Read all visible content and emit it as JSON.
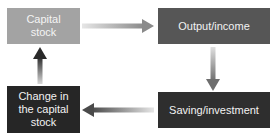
{
  "diagram": {
    "type": "cycle-flow",
    "nodes": [
      {
        "id": "capital_stock",
        "label": "Capital\nstock",
        "color": "#a3a3a3"
      },
      {
        "id": "output_income",
        "label": "Output/income",
        "color": "#565656"
      },
      {
        "id": "saving_investment",
        "label": "Saving/investment",
        "color": "#2e2e2e"
      },
      {
        "id": "change_capital_stock",
        "label": "Change in\nthe capital\nstock",
        "color": "#262626"
      }
    ],
    "edges": [
      {
        "from": "capital_stock",
        "to": "output_income",
        "direction": "right"
      },
      {
        "from": "output_income",
        "to": "saving_investment",
        "direction": "down"
      },
      {
        "from": "saving_investment",
        "to": "change_capital_stock",
        "direction": "left"
      },
      {
        "from": "change_capital_stock",
        "to": "capital_stock",
        "direction": "up"
      }
    ]
  },
  "labels": {
    "capital_stock_l1": "Capital",
    "capital_stock_l2": "stock",
    "output_income": "Output/income",
    "saving_investment": "Saving/investment",
    "change_l1": "Change in",
    "change_l2": "the capital",
    "change_l3": "stock"
  }
}
